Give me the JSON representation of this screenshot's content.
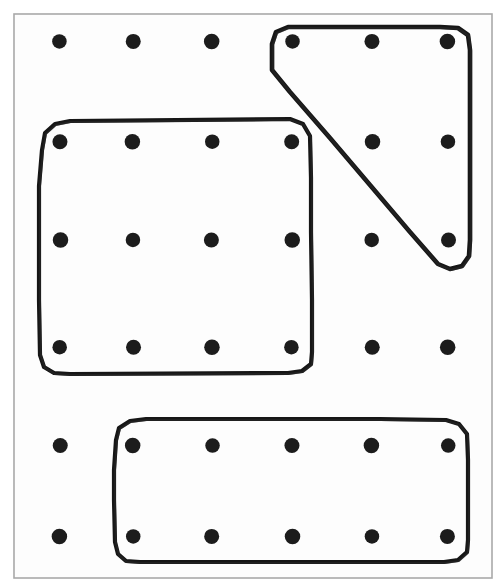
{
  "figure": {
    "title": "Dot grid with three hand-drawn enclosing loops",
    "canvas": {
      "width": 500,
      "height": 588
    },
    "background_color": "#ffffff",
    "ink_color": "#161616",
    "dot_color": "#1c1c1c",
    "frame_color": "#a9a9a9"
  },
  "outer_frame": {
    "label": "outer-border",
    "x": 14,
    "y": 14,
    "width": 478,
    "height": 564,
    "stroke_width": 1.6
  },
  "dot_grid": {
    "label": "dot-grid",
    "rows": 6,
    "columns": 6,
    "dot_radius": 7.5,
    "column_centers": [
      60,
      133,
      212,
      292,
      372,
      448
    ],
    "row_centers": [
      42,
      142,
      240,
      347,
      445,
      537
    ],
    "total_dots": 36
  },
  "shapes": [
    {
      "id": "shape-rounded-rectangle-large",
      "name": "large-rounded-rectangle",
      "kind": "rounded-rectangle",
      "stroke_width": 4.2,
      "corner_radius": 18,
      "bounds": {
        "x": 38,
        "y": 122,
        "width": 274,
        "height": 251
      },
      "enclosed_dot_count": 12,
      "points": "42,150 45,133 55,124 70,121 290,119 303,124 310,136 311,178 311,232 312,300 312,352 311,364 302,371 288,373 70,374 54,373 44,367 40,355 39,300 39,232 39,186"
    },
    {
      "id": "shape-triangle",
      "name": "triangle-loop",
      "kind": "triangle",
      "stroke_width": 4.6,
      "corner_radius": 14,
      "bounds": {
        "x": 266,
        "y": 26,
        "width": 206,
        "height": 244
      },
      "enclosed_dot_count": 6,
      "points": "272,44 276,32 288,27 310,27 380,27 440,27 458,28 468,35 470,50 470,110 470,180 470,240 469,256 462,266 450,269 438,264 410,232 370,185 330,138 290,92 272,70"
    },
    {
      "id": "shape-rounded-rectangle-bottom",
      "name": "bottom-rounded-rectangle",
      "kind": "rounded-rectangle",
      "stroke_width": 4.2,
      "corner_radius": 18,
      "bounds": {
        "x": 112,
        "y": 419,
        "width": 356,
        "height": 144
      },
      "enclosed_dot_count": 10,
      "points": "116,440 119,428 130,421 146,419 260,419 380,419 446,420 459,424 467,434 468,460 468,500 468,540 467,552 458,560 444,562 320,562 200,562 140,562 126,561 118,554 115,542 114,500 114,470"
    }
  ],
  "dots_in_shapes": {
    "large_rectangle_rows": [
      142,
      240,
      347
    ],
    "large_rectangle_columns": [
      60,
      133,
      212,
      292
    ],
    "triangle_dots": [
      {
        "x": 292,
        "y": 42
      },
      {
        "x": 372,
        "y": 42
      },
      {
        "x": 448,
        "y": 42
      },
      {
        "x": 372,
        "y": 142
      },
      {
        "x": 448,
        "y": 142
      },
      {
        "x": 448,
        "y": 240
      }
    ],
    "bottom_rectangle_rows": [
      445,
      537
    ],
    "bottom_rectangle_columns": [
      133,
      212,
      292,
      372,
      448
    ]
  }
}
